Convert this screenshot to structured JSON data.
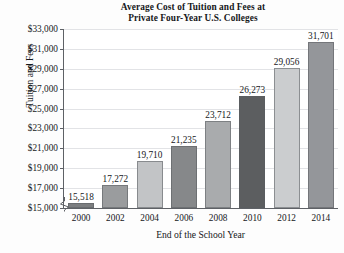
{
  "chart_data": {
    "type": "bar",
    "title": "Average Cost of Tuition and Fees at Private Four-Year U.S. Colleges",
    "title_line1": "Average Cost of Tuition and Fees at",
    "title_line2": "Private Four-Year U.S. Colleges",
    "xlabel": "End of the School Year",
    "ylabel": "Tuition and Fees",
    "categories": [
      "2000",
      "2002",
      "2004",
      "2006",
      "2008",
      "2010",
      "2012",
      "2014"
    ],
    "values": [
      15518,
      17272,
      19710,
      21235,
      23712,
      26273,
      29056,
      31701
    ],
    "data_labels": [
      "15,518",
      "17,272",
      "19,710",
      "21,235",
      "23,712",
      "26,273",
      "29,056",
      "31,701"
    ],
    "bar_colors": [
      "#7c7e80",
      "#9a9c9e",
      "#c2c4c6",
      "#86888a",
      "#a9abad",
      "#5c5e60",
      "#cbcdcf",
      "#94969a"
    ],
    "ylim": [
      15000,
      33000
    ],
    "ytick_labels": [
      "$33,000",
      "$31,000",
      "$29,000",
      "$27,000",
      "$25,000",
      "$23,000",
      "$21,000",
      "$19,000",
      "$17,000",
      "$15,000"
    ],
    "ytick_values": [
      33000,
      31000,
      29000,
      27000,
      25000,
      23000,
      21000,
      19000,
      17000,
      15000
    ],
    "grid": true,
    "axis_break": true,
    "legend": null
  }
}
